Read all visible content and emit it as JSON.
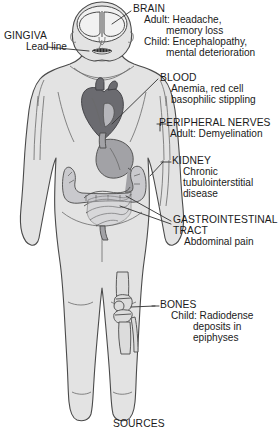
{
  "diagram": {
    "title_bottom": "SOURCES",
    "colors": {
      "body_fill": "#e3e3e3",
      "outline": "#4a4a4a",
      "brain_fill": "#f2f2f2",
      "heart_fill": "#6b6b70",
      "gi_fill": "#9a9a9e",
      "bone_fill": "#d6d6d6",
      "lead_line": "#2b2b2b",
      "text": "#1a1a1a"
    }
  },
  "labels": {
    "brain": {
      "heading": "BRAIN",
      "lines": [
        "Adult: Headache,",
        "memory loss",
        "Child: Encephalopathy,",
        "mental deterioration"
      ]
    },
    "gingiva": {
      "heading": "GINGIVA",
      "lines": [
        "Lead line"
      ]
    },
    "blood": {
      "heading": "BLOOD",
      "lines": [
        "Anemia, red cell",
        "basophilic stippling"
      ]
    },
    "peripheral_nerves": {
      "heading": "PERIPHERAL NERVES",
      "lines": [
        "Adult: Demyelination"
      ]
    },
    "kidney": {
      "heading": "KIDNEY",
      "lines": [
        "Chronic",
        "tubulointerstitial",
        "disease"
      ]
    },
    "gastrointestinal": {
      "heading": "GASTROINTESTINAL",
      "heading2": "TRACT",
      "lines": [
        "Abdominal pain"
      ]
    },
    "bones": {
      "heading": "BONES",
      "lines": [
        "Child: Radiodense",
        "deposits in",
        "epiphyses"
      ]
    }
  },
  "anatomy": {
    "head": "head-outline",
    "brain": "brain-hemispheres",
    "lead_line": "gingival-lead-line",
    "heart": "heart-organ",
    "stomach": "stomach-organ",
    "intestines": "intestines-organ",
    "knee_bone": "knee-epiphysis-bone",
    "nerve_lines": "peripheral-nerve-lines"
  }
}
